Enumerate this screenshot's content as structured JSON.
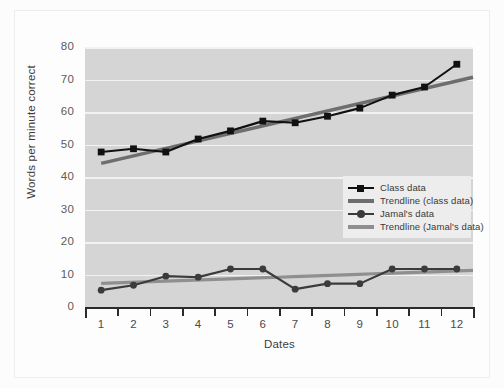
{
  "chart_data": {
    "type": "line",
    "title": "",
    "xlabel": "Dates",
    "ylabel": "Words per minute correct",
    "categories": [
      "1",
      "2",
      "3",
      "4",
      "5",
      "6",
      "7",
      "8",
      "9",
      "10",
      "11",
      "12"
    ],
    "x": [
      1,
      2,
      3,
      4,
      5,
      6,
      7,
      8,
      9,
      10,
      11,
      12
    ],
    "xlim": [
      0.5,
      12.5
    ],
    "ylim": [
      0,
      80
    ],
    "ytick_labels": [
      "0",
      "10",
      "20",
      "30",
      "40",
      "50",
      "60",
      "70",
      "80"
    ],
    "yticks": [
      0,
      10,
      20,
      30,
      40,
      50,
      60,
      70,
      80
    ],
    "grid": "horizontal",
    "legend_position": "center-right",
    "series": [
      {
        "name": "Class data",
        "marker": "square",
        "color": "#111111",
        "values": [
          48,
          49,
          48,
          52,
          54.5,
          57.5,
          57,
          59,
          61.5,
          65.5,
          68,
          75
        ]
      },
      {
        "name": "Trendline (class data)",
        "marker": "none",
        "color": "#6e6e6e",
        "endpoints": [
          44.5,
          71
        ]
      },
      {
        "name": "Jamal's data",
        "marker": "circle",
        "color": "#3b3b3b",
        "values": [
          5.5,
          7,
          9.8,
          9.5,
          12,
          12,
          5.8,
          7.5,
          7.5,
          12,
          12,
          12
        ]
      },
      {
        "name": "Trendline (Jamal's data)",
        "marker": "none",
        "color": "#8f8f8f",
        "endpoints": [
          7.6,
          11.6
        ]
      }
    ]
  },
  "legend": {
    "items": [
      {
        "label": "Class data",
        "key": "line-square-marker"
      },
      {
        "label": "Trendline (class data)",
        "key": "line-plain"
      },
      {
        "label": "Jamal's data",
        "key": "line-circle-marker"
      },
      {
        "label": "Trendline (Jamal's data)",
        "key": "line-plain"
      }
    ]
  },
  "colors": {
    "plot_background": "#d5d5d5",
    "gridline": "#f2f2f2",
    "axis": "#2b2b2b",
    "class_data": "#111111",
    "class_trendline": "#6e6e6e",
    "jamal_data": "#3b3b3b",
    "jamal_trendline": "#8f8f8f",
    "legend_background": "#ededed"
  }
}
